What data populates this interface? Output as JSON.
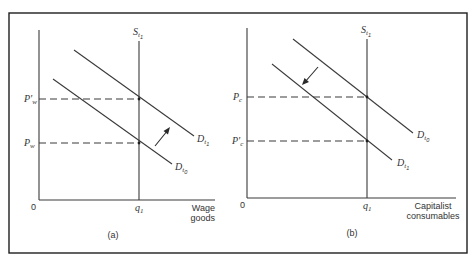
{
  "figure": {
    "panels": [
      {
        "id": "a",
        "caption": "(a)",
        "origin_label": "0",
        "x_axis_label_line1": "Wage",
        "x_axis_label_line2": "goods",
        "quantity_label": "q",
        "quantity_sub": "1",
        "supply_label": "S",
        "supply_sub": "t",
        "supply_subsub": "1",
        "price_high_label": "P'",
        "price_high_sub": "w",
        "price_low_label": "P",
        "price_low_sub": "w",
        "demand_upper_label": "D",
        "demand_upper_sub": "t",
        "demand_upper_subsub": "1",
        "demand_lower_label": "D",
        "demand_lower_sub": "t",
        "demand_lower_subsub": "0",
        "shift_direction": "outward (up-right)"
      },
      {
        "id": "b",
        "caption": "(b)",
        "origin_label": "0",
        "x_axis_label_line1": "Capitalist",
        "x_axis_label_line2": "consumables",
        "quantity_label": "q",
        "quantity_sub": "1",
        "supply_label": "S",
        "supply_sub": "t",
        "supply_subsub": "1",
        "price_high_label": "P",
        "price_high_sub": "c",
        "price_low_label": "P'",
        "price_low_sub": "c",
        "demand_upper_label": "D",
        "demand_upper_sub": "t",
        "demand_upper_subsub": "0",
        "demand_lower_label": "D",
        "demand_lower_sub": "t",
        "demand_lower_subsub": "1",
        "shift_direction": "inward (down-left)"
      }
    ],
    "colors": {
      "line": "#3a3a3a",
      "frame": "#1e1e1e",
      "background": "#ffffff"
    }
  }
}
